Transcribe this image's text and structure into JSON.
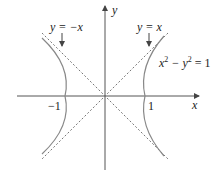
{
  "figure": {
    "axes": {
      "x_label": "x",
      "y_label": "y"
    },
    "ticks": {
      "neg_one": "−1",
      "one": "1"
    },
    "asymptotes": [
      {
        "label": "y = −x",
        "slope": -1
      },
      {
        "label": "y = x",
        "slope": 1
      }
    ],
    "curve": {
      "equation_main": "x",
      "sup1": "2",
      "minus_y": " − y",
      "sup2": "2",
      "equals": " = 1"
    },
    "colors": {
      "curve": "#888888",
      "axes": "#555555",
      "asymptote": "#777777"
    }
  }
}
